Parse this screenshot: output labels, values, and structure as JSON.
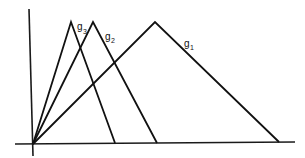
{
  "diagram": {
    "functions": [
      {
        "id": "g1",
        "label": "g",
        "subscript": "1"
      },
      {
        "id": "g2",
        "label": "g",
        "subscript": "2"
      },
      {
        "id": "g3",
        "label": "g",
        "subscript": "3"
      }
    ],
    "colors": {
      "stroke": "#111111",
      "background": "#ffffff"
    }
  }
}
